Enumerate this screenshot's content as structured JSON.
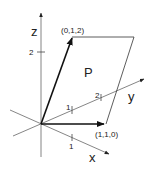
{
  "diagram": {
    "axes": {
      "x": {
        "label": "x",
        "ticks": [
          {
            "label": "1"
          }
        ]
      },
      "y": {
        "label": "y",
        "ticks": [
          {
            "label": "1"
          },
          {
            "label": "2"
          }
        ]
      },
      "z": {
        "label": "z",
        "ticks": [
          {
            "label": "2"
          }
        ]
      }
    },
    "vectors": [
      {
        "name": "u",
        "label": "(0,1,2)",
        "components": [
          0,
          1,
          2
        ]
      },
      {
        "name": "v",
        "label": "(1,1,0)",
        "components": [
          1,
          1,
          0
        ]
      }
    ],
    "region": {
      "label": "P",
      "description": "parallelogram spanned by (0,1,2) and (1,1,0)"
    },
    "colors": {
      "axis": "#666666",
      "vector": "#111111",
      "edge": "#333333",
      "text": "#222222"
    }
  }
}
